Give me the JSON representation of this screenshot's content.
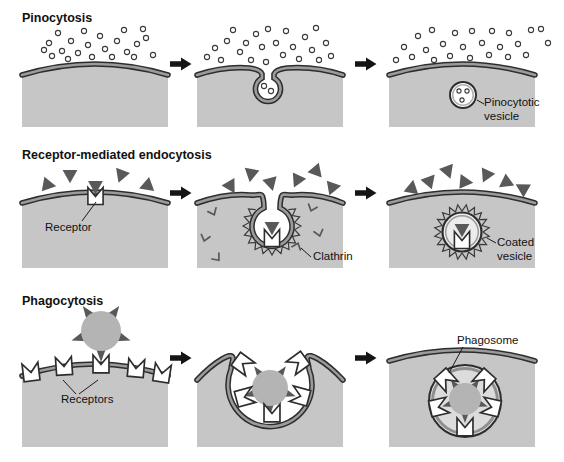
{
  "rows": [
    {
      "id": "pinocytosis",
      "title": "Pinocytosis",
      "callouts": [
        {
          "id": "pinocytotic-vesicle",
          "text": "Pinocytotic vesicle"
        }
      ]
    },
    {
      "id": "receptor-mediated-endocytosis",
      "title": "Receptor-mediated endocytosis",
      "callouts": [
        {
          "id": "receptor",
          "text": "Receptor"
        },
        {
          "id": "clathrin",
          "text": "Clathrin"
        },
        {
          "id": "coated-vesicle",
          "text": "Coated vesicle"
        }
      ]
    },
    {
      "id": "phagocytosis",
      "title": "Phagocytosis",
      "callouts": [
        {
          "id": "receptors",
          "text": "Receptors"
        },
        {
          "id": "phagosome",
          "text": "Phagosome"
        }
      ]
    }
  ],
  "colors": {
    "background": "#ffffff",
    "cytoplasm": "#c6c6c6",
    "membrane_line": "#2d2d2d",
    "membrane_band": "#9b9b9b",
    "particle_gray": "#595959",
    "particle_core": "#b4b4b4",
    "vesicle_interior": "#ececec",
    "phagosome_interior": "#dcdcdc",
    "arrow": "#151515",
    "label_text": "#111111"
  }
}
